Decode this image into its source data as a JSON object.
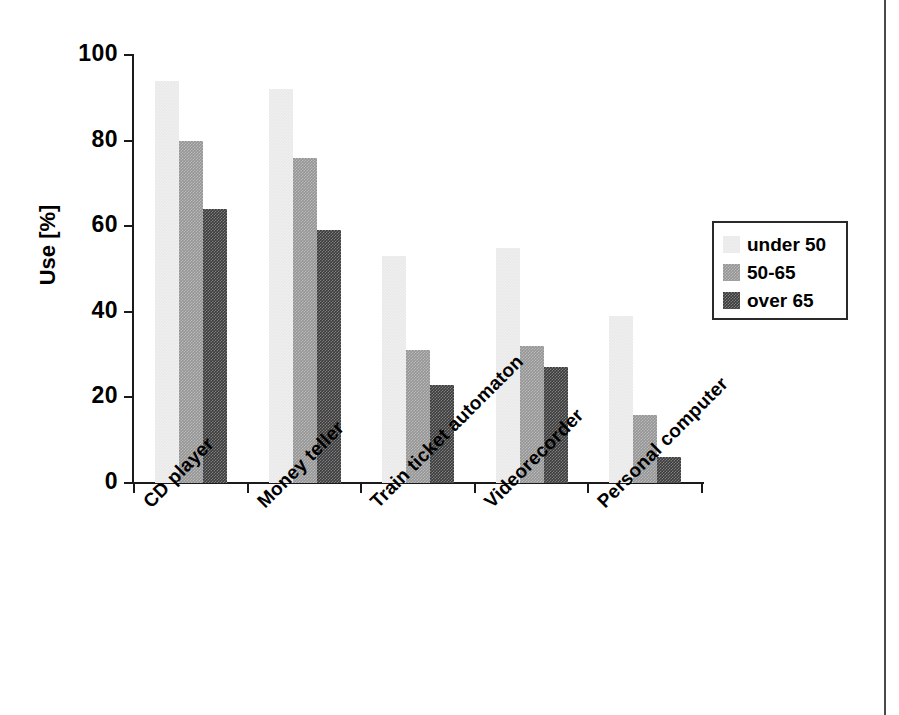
{
  "chart_data": {
    "type": "bar",
    "title": "",
    "xlabel": "",
    "ylabel": "Use [%]",
    "ylim": [
      0,
      100
    ],
    "yticks": [
      0,
      20,
      40,
      60,
      80,
      100
    ],
    "ytick_labels": [
      "0",
      "20",
      "40",
      "60",
      "80",
      "100"
    ],
    "grid": false,
    "legend_position": "right",
    "categories": [
      "CD player",
      "Money teller",
      "Train ticket automaton",
      "Videorecorder",
      "Personal computer"
    ],
    "series": [
      {
        "name": "under 50",
        "color": "#e9e9e9",
        "values": [
          94,
          92,
          53,
          55,
          39
        ]
      },
      {
        "name": "50-65",
        "color": "#959595",
        "values": [
          80,
          76,
          31,
          32,
          16
        ]
      },
      {
        "name": "over 65",
        "color": "#3b3b3b",
        "values": [
          64,
          59,
          23,
          27,
          6
        ]
      }
    ]
  },
  "legend": {
    "items": [
      {
        "label": "under 50",
        "color": "#e9e9e9"
      },
      {
        "label": "50-65",
        "color": "#959595"
      },
      {
        "label": "over 65",
        "color": "#3b3b3b"
      }
    ]
  },
  "axis": {
    "y_title": "Use [%]"
  }
}
